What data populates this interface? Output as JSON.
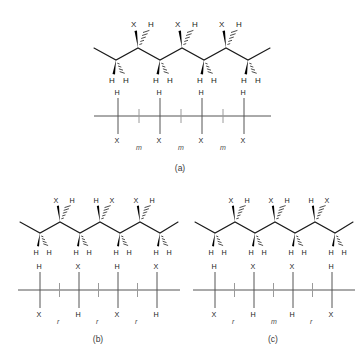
{
  "figure": {
    "background_color": "#ffffff",
    "line_color": "#1a1a1a",
    "dyad_color": "#4a4a4a",
    "substituent_label": "X",
    "hydrogen_label": "H",
    "meso_label": "m",
    "racemo_label": "r"
  },
  "panels": [
    {
      "id": "a",
      "caption": "(a)",
      "tacticity": "isotactic",
      "zigzag": {
        "top_substituents": [
          {
            "wedge": "X",
            "hash": "H"
          },
          {
            "wedge": "X",
            "hash": "H"
          },
          {
            "wedge": "X",
            "hash": "H"
          }
        ],
        "bottom_hydrogens": [
          "H",
          "H",
          "H",
          "H",
          "H",
          "H",
          "H",
          "H"
        ]
      },
      "line": {
        "up_labels": [
          "H",
          "H",
          "H",
          "H"
        ],
        "down_labels": [
          "X",
          "X",
          "X",
          "X"
        ],
        "dyads": [
          "m",
          "m",
          "m"
        ]
      }
    },
    {
      "id": "b",
      "caption": "(b)",
      "tacticity": "syndiotactic",
      "zigzag": {
        "top_substituents": [
          {
            "wedge": "X",
            "hash": "H"
          },
          {
            "wedge": "H",
            "hash": "X"
          },
          {
            "wedge": "X",
            "hash": "H"
          }
        ],
        "bottom_hydrogens": [
          "H",
          "H",
          "H",
          "H",
          "H",
          "H",
          "H",
          "H"
        ]
      },
      "line": {
        "up_labels": [
          "H",
          "X",
          "H",
          "X"
        ],
        "down_labels": [
          "X",
          "H",
          "X",
          "H"
        ],
        "dyads": [
          "r",
          "r",
          "r"
        ]
      }
    },
    {
      "id": "c",
      "caption": "(c)",
      "tacticity": "atactic",
      "zigzag": {
        "top_substituents": [
          {
            "wedge": "X",
            "hash": "H"
          },
          {
            "wedge": "X",
            "hash": "H"
          },
          {
            "wedge": "H",
            "hash": "X"
          }
        ],
        "bottom_hydrogens": [
          "H",
          "H",
          "H",
          "H",
          "H",
          "H",
          "H",
          "H"
        ]
      },
      "line": {
        "up_labels": [
          "H",
          "X",
          "X",
          "H"
        ],
        "down_labels": [
          "X",
          "H",
          "H",
          "X"
        ],
        "dyads": [
          "r",
          "m",
          "r"
        ]
      }
    }
  ]
}
